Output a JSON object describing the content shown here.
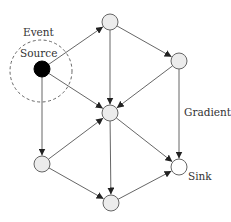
{
  "diagram": {
    "labels": {
      "event": "Event",
      "source": "Source",
      "gradient": "Gradient",
      "sink": "Sink"
    },
    "nodes": [
      {
        "id": "source",
        "x": 42,
        "y": 69,
        "type": "source"
      },
      {
        "id": "top",
        "x": 110,
        "y": 22,
        "type": "node"
      },
      {
        "id": "right",
        "x": 179,
        "y": 61,
        "type": "node"
      },
      {
        "id": "center",
        "x": 110,
        "y": 113,
        "type": "node"
      },
      {
        "id": "left",
        "x": 42,
        "y": 164,
        "type": "node"
      },
      {
        "id": "sink",
        "x": 179,
        "y": 167,
        "type": "sink"
      },
      {
        "id": "bottom",
        "x": 111,
        "y": 203,
        "type": "node"
      }
    ],
    "edges": [
      [
        "source",
        "top"
      ],
      [
        "source",
        "center"
      ],
      [
        "source",
        "left"
      ],
      [
        "top",
        "right"
      ],
      [
        "top",
        "center"
      ],
      [
        "right",
        "center"
      ],
      [
        "right",
        "sink"
      ],
      [
        "left",
        "center"
      ],
      [
        "left",
        "bottom"
      ],
      [
        "center",
        "sink"
      ],
      [
        "center",
        "bottom"
      ],
      [
        "bottom",
        "sink"
      ]
    ],
    "colors": {
      "node_fill": "#ececec",
      "sink_fill": "#ffffff",
      "source_fill": "#000000",
      "stroke": "#555555"
    }
  }
}
